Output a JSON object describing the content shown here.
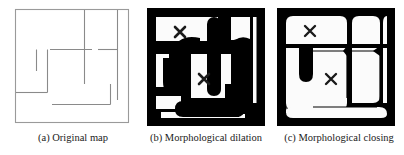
{
  "figure": {
    "panels": [
      {
        "id": "a",
        "caption": "(a) Original map",
        "title": "Original map",
        "kind": "line-map",
        "description": "Thin grey line drawing of an indoor floor plan with outer rectangle and interior wall segments."
      },
      {
        "id": "b",
        "caption": "(b) Morphological dilation",
        "title": "Morphological dilation",
        "kind": "binary-image",
        "description": "Black dilated walls on white free space with two X markers."
      },
      {
        "id": "c",
        "caption": "(c) Morphological closing",
        "title": "Morphological closing",
        "kind": "binary-image",
        "description": "Black closed wall border with rounded corners on white free space with two X markers."
      }
    ],
    "markers": {
      "glyph": "✕",
      "label": "x-marker",
      "panel_b": [
        {
          "x": 33,
          "y": 24
        },
        {
          "x": 57,
          "y": 71
        }
      ],
      "panel_c": [
        {
          "x": 33,
          "y": 24
        },
        {
          "x": 57,
          "y": 71
        }
      ]
    },
    "colors": {
      "ink": "#000000",
      "map_line": "#8a8a8a",
      "map_border": "#9a9a9a",
      "background": "#ffffff",
      "caption_text": "#1a1a1a",
      "free_space": "#fbfbfb"
    }
  }
}
